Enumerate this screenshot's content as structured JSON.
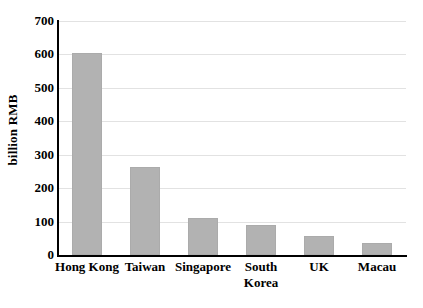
{
  "chart_data": {
    "type": "bar",
    "title": "",
    "xlabel": "",
    "ylabel": "billion RMB",
    "categories": [
      "Hong Kong",
      "Taiwan",
      "Singapore",
      "South\nKorea",
      "UK",
      "Macau"
    ],
    "values": [
      605,
      264,
      111,
      90,
      57,
      35
    ],
    "ylim": [
      0,
      700
    ],
    "yticks": [
      0,
      100,
      200,
      300,
      400,
      500,
      600,
      700
    ],
    "ytick_labels": [
      "0",
      "100",
      "200",
      "300",
      "400",
      "500",
      "600",
      "700"
    ],
    "grid": "horizontal",
    "legend": "none",
    "bar_color": "#b2b2b2",
    "axis_color": "#000000",
    "gridline_color": "#e2e2e2"
  }
}
